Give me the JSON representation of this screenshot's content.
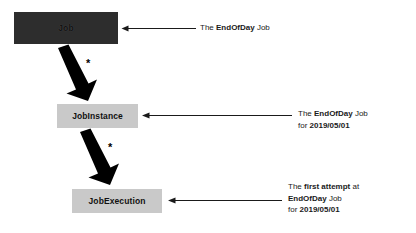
{
  "diagram": {
    "background_color": "#ffffff"
  },
  "nodes": [
    {
      "id": "job",
      "label": "Job",
      "fill": "#2d2d2d",
      "text_color": "#111111"
    },
    {
      "id": "job-instance",
      "label": "JobInstance",
      "fill": "#c9c9c9",
      "text_color": "#111111"
    },
    {
      "id": "job-execution",
      "label": "JobExecution",
      "fill": "#c9c9c9",
      "text_color": "#111111"
    }
  ],
  "relations": [
    {
      "id": "job-to-jobinstance",
      "from": "job",
      "to": "job-instance",
      "multiplicity": "*"
    },
    {
      "id": "jobinstance-to-jobexecution",
      "from": "job-instance",
      "to": "job-execution",
      "multiplicity": "*"
    }
  ],
  "annotations": [
    {
      "id": "annotation-job",
      "target": "job",
      "lines": [
        {
          "prefix": "The ",
          "bold": "EndOfDay",
          "suffix": " Job"
        }
      ]
    },
    {
      "id": "annotation-job-instance",
      "target": "job-instance",
      "lines": [
        {
          "prefix": "The ",
          "bold": "EndOfDay",
          "suffix": " Job"
        },
        {
          "prefix": "for ",
          "bold": "2019/05/01",
          "suffix": ""
        }
      ]
    },
    {
      "id": "annotation-job-execution",
      "target": "job-execution",
      "lines": [
        {
          "prefix": "The ",
          "bold": "first attempt",
          "suffix": " at"
        },
        {
          "prefix": "",
          "bold": "EndOfDay",
          "suffix": " Job"
        },
        {
          "prefix": "for ",
          "bold": "2019/05/01",
          "suffix": ""
        }
      ]
    }
  ]
}
